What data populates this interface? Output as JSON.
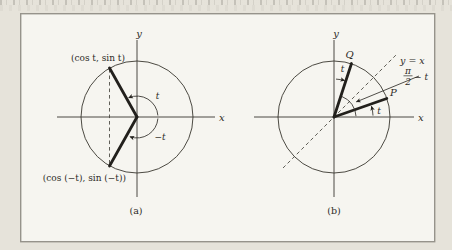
{
  "figure": {
    "ink_color": "#2d2b27",
    "paper_color": "#f6f5f0",
    "margin_color": "#e6e3da",
    "frame_border_color": "#96938b"
  },
  "diagram_a": {
    "y_axis_label": "y",
    "x_axis_label": "x",
    "upper_point_label": "(cos t, sin t)",
    "lower_point_label": "(cos (−t), sin (−t))",
    "positive_angle_label": "t",
    "negative_angle_label": "−t",
    "caption": "(a)"
  },
  "diagram_b": {
    "y_axis_label": "y",
    "x_axis_label": "x",
    "identity_line_label": "y = x",
    "q_point_label": "Q",
    "p_point_label": "P",
    "q_angle_label": "t",
    "p_angle_label": "t",
    "complement_numerator": "π",
    "complement_denominator": "2",
    "complement_suffix": "− t",
    "caption": "(b)"
  }
}
